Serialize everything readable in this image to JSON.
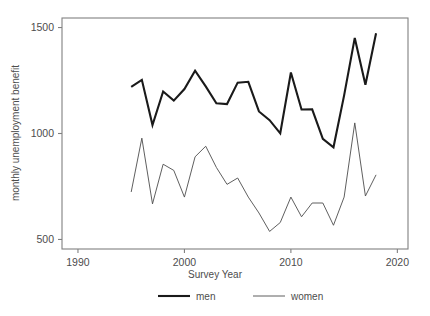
{
  "chart_data": {
    "type": "line",
    "title": "",
    "xlabel": "Survey Year",
    "ylabel": "monthly unemployment benefit",
    "xlim": [
      1988.5,
      2021.0
    ],
    "ylim": [
      455,
      1545
    ],
    "xticks": [
      1990,
      2000,
      2010,
      2020
    ],
    "xtick_labels": [
      "1990",
      "2000",
      "2010",
      "2020"
    ],
    "yticks": [
      500,
      1000,
      1500
    ],
    "ytick_labels": [
      "500",
      "1000",
      "1500"
    ],
    "grid": false,
    "legend_position": "bottom",
    "series": [
      {
        "name": "men",
        "color": "#1a1a1a",
        "line_width": 2.1,
        "x": [
          1995,
          1996,
          1997,
          1998,
          1999,
          2000,
          2001,
          2002,
          2003,
          2004,
          2005,
          2006,
          2007,
          2008,
          2009,
          2010,
          2011,
          2012,
          2013,
          2014,
          2015,
          2016,
          2017,
          2018
        ],
        "values": [
          1220,
          1253,
          1040,
          1198,
          1155,
          1210,
          1296,
          1222,
          1143,
          1139,
          1240,
          1244,
          1104,
          1063,
          1001,
          1288,
          1113,
          1114,
          975,
          935,
          1180,
          1451,
          1230,
          1473
        ]
      },
      {
        "name": "women",
        "color": "#4d4d4d",
        "line_width": 0.9,
        "x": [
          1995,
          1996,
          1997,
          1998,
          1999,
          2000,
          2001,
          2002,
          2003,
          2004,
          2005,
          2006,
          2007,
          2008,
          2009,
          2010,
          2011,
          2012,
          2013,
          2014,
          2015,
          2016,
          2017,
          2018
        ],
        "values": [
          724,
          978,
          668,
          855,
          826,
          700,
          890,
          940,
          840,
          760,
          790,
          700,
          625,
          538,
          580,
          700,
          607,
          672,
          672,
          567,
          700,
          1050,
          705,
          805
        ]
      }
    ]
  },
  "legend": {
    "items": [
      {
        "label": "men"
      },
      {
        "label": "women"
      }
    ]
  }
}
